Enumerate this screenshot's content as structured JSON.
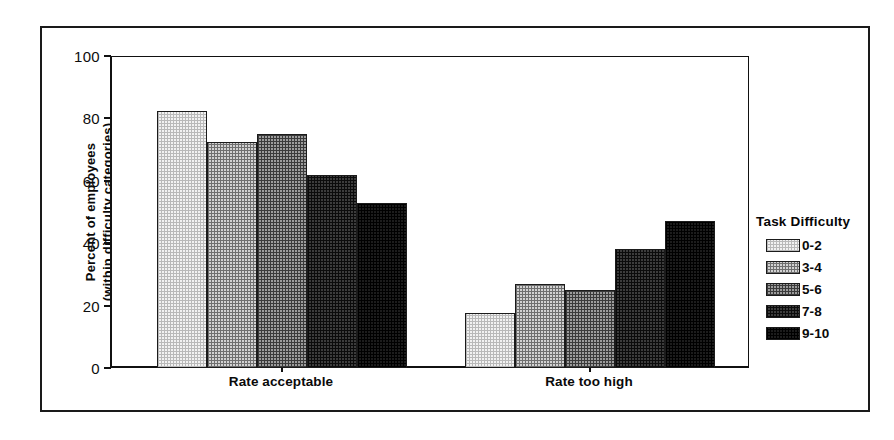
{
  "chart_data": {
    "type": "bar",
    "title": "",
    "subtitle": "",
    "xlabel": "",
    "ylabel": "Percent of employees (within difficulty categories)",
    "ylabel_lines": [
      "Percent of employees",
      "(within difficulty categories)"
    ],
    "categories": [
      "Rate acceptable",
      "Rate too high"
    ],
    "ylim": [
      0,
      100
    ],
    "yticks": [
      0,
      20,
      40,
      60,
      80,
      100
    ],
    "ytick_labels": [
      "0",
      "20",
      "40",
      "60",
      "80",
      "100"
    ],
    "grid": false,
    "legend_position": "right",
    "legend_title": "Task Difficulty",
    "series": [
      {
        "name": "0-2",
        "values": [
          82.5,
          17.5
        ]
      },
      {
        "name": "3-4",
        "values": [
          72.5,
          27.0
        ]
      },
      {
        "name": "5-6",
        "values": [
          75.0,
          25.0
        ]
      },
      {
        "name": "7-8",
        "values": [
          62.0,
          38.0
        ]
      },
      {
        "name": "9-10",
        "values": [
          53.0,
          47.0
        ]
      }
    ]
  },
  "legend": {
    "title": "Task Difficulty",
    "items": [
      {
        "label": "0-2"
      },
      {
        "label": "3-4"
      },
      {
        "label": "5-6"
      },
      {
        "label": "7-8"
      },
      {
        "label": "9-10"
      }
    ]
  },
  "axes": {
    "y_title_line1": "Percent of employees",
    "y_title_line2": "(within difficulty categories)",
    "y_ticks": [
      "100",
      "80",
      "60",
      "40",
      "20",
      "0"
    ],
    "x_categories": [
      "Rate acceptable",
      "Rate too high"
    ]
  },
  "colors": {
    "frame": "#1a1a1a",
    "axis": "#111111",
    "text": "#0a0a0a",
    "background": "#ffffff",
    "series_fills": [
      "#f2f2f2",
      "#d2d2d2",
      "#9c9c9c",
      "#3c3c3c",
      "#1c1c1c"
    ]
  }
}
